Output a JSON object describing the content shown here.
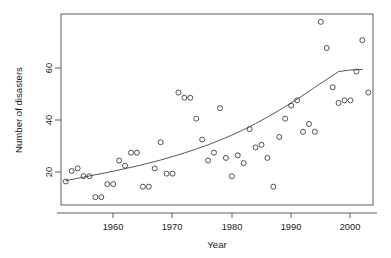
{
  "chart_data": {
    "type": "scatter",
    "title": "",
    "subtitle": "",
    "xlabel": "Year",
    "ylabel": "Number of disasters",
    "xlim": [
      1952.2,
      2004.8
    ],
    "ylim": [
      5.0,
      78.0
    ],
    "xticks": [
      1960,
      1970,
      1980,
      1990,
      2000
    ],
    "xtick_labels": [
      "1960",
      "1970",
      "1980",
      "1990",
      "2000"
    ],
    "yticks": [
      20,
      40,
      60
    ],
    "ytick_labels": [
      "20",
      "40",
      "60"
    ],
    "grid": false,
    "legend": null,
    "legend_position": "none",
    "frame": "box",
    "point_marker": "open-circle",
    "point_color": "#333333",
    "curve_color": "#4d4d4d",
    "x": [
      1953,
      1954,
      1955,
      1956,
      1957,
      1958,
      1959,
      1960,
      1961,
      1962,
      1963,
      1964,
      1965,
      1966,
      1967,
      1968,
      1969,
      1970,
      1971,
      1972,
      1973,
      1974,
      1975,
      1976,
      1977,
      1978,
      1979,
      1980,
      1981,
      1982,
      1983,
      1984,
      1985,
      1986,
      1987,
      1988,
      1989,
      1990,
      1991,
      1992,
      1993,
      1994,
      1995,
      1996,
      1997,
      1998,
      1999,
      2000,
      2001,
      2002,
      2003,
      2004
    ],
    "y": [
      14,
      18,
      19,
      16,
      16,
      8,
      8,
      13,
      13,
      22,
      20,
      25,
      25,
      12,
      12,
      19,
      29,
      17,
      17,
      48,
      46,
      46,
      38,
      30,
      22,
      25,
      42,
      23,
      16,
      24,
      21,
      34,
      27,
      28,
      23,
      12,
      31,
      38,
      43,
      45,
      33,
      36,
      33,
      75,
      65,
      50,
      44,
      45,
      45,
      56,
      68,
      48
    ],
    "series": [
      {
        "name": "Observed disasters",
        "type": "scatter",
        "values": [
          14,
          18,
          19,
          16,
          16,
          8,
          8,
          13,
          13,
          22,
          20,
          25,
          25,
          12,
          12,
          19,
          29,
          17,
          17,
          48,
          46,
          46,
          38,
          30,
          22,
          25,
          42,
          23,
          16,
          24,
          21,
          34,
          27,
          28,
          23,
          12,
          31,
          38,
          43,
          45,
          33,
          36,
          33,
          75,
          65,
          50,
          44,
          45,
          45,
          56,
          68,
          48
        ]
      },
      {
        "name": "Fitted trend",
        "type": "line",
        "x": [
          1953,
          1955,
          1957,
          1959,
          1961,
          1963,
          1965,
          1967,
          1969,
          1971,
          1973,
          1975,
          1977,
          1979,
          1981,
          1983,
          1985,
          1987,
          1989,
          1991,
          1993,
          1995,
          1997,
          1999,
          2001,
          2003
        ],
        "values": [
          14.3,
          15.2,
          16.1,
          17.0,
          17.9,
          18.9,
          19.9,
          21.0,
          22.2,
          23.5,
          24.9,
          26.4,
          28.0,
          29.8,
          31.7,
          33.8,
          36.1,
          38.6,
          41.2,
          44.0,
          46.9,
          50.0,
          53.0,
          56.0,
          56.6,
          56.8
        ]
      }
    ],
    "annotations": []
  },
  "axes": {
    "x_title": "Year",
    "y_title": "Number of disasters"
  }
}
